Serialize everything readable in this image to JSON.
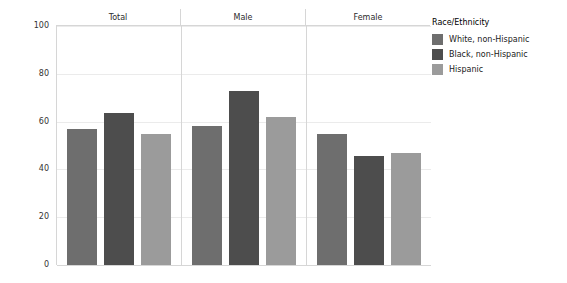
{
  "chart_data": {
    "type": "bar",
    "title": "",
    "xlabel": "",
    "ylabel": "Percent",
    "ylim": [
      0,
      100
    ],
    "yticks": [
      0,
      20,
      40,
      60,
      80,
      100
    ],
    "grid": true,
    "legend_position": "right",
    "legend_title": "Race/Ethnicity",
    "categories": [
      "Total",
      "Male",
      "Female"
    ],
    "series": [
      {
        "name": "White, non-Hispanic",
        "color": "#6e6e6e",
        "values": [
          57,
          58,
          55
        ]
      },
      {
        "name": "Black, non-Hispanic",
        "color": "#4d4d4d",
        "values": [
          63.5,
          73,
          45.5
        ]
      },
      {
        "name": "Hispanic",
        "color": "#9b9b9b",
        "values": [
          55,
          62,
          47
        ]
      }
    ]
  },
  "axis": {
    "y_label": "Percent",
    "y_tick_labels": [
      "100",
      "80",
      "60",
      "40",
      "20",
      "0"
    ]
  },
  "panels": [
    {
      "label": "Total"
    },
    {
      "label": "Male"
    },
    {
      "label": "Female"
    }
  ],
  "legend": {
    "title": "Race/Ethnicity",
    "items": [
      {
        "label": "White, non-Hispanic",
        "color": "#6e6e6e"
      },
      {
        "label": "Black, non-Hispanic",
        "color": "#4d4d4d"
      },
      {
        "label": "Hispanic",
        "color": "#9b9b9b"
      }
    ]
  }
}
